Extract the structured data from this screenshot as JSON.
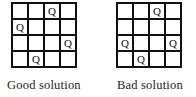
{
  "boards": [
    {
      "caption": "Good solution",
      "queen_label": "Q",
      "cells": [
        [
          "",
          "",
          "Q",
          ""
        ],
        [
          "Q",
          "",
          "",
          ""
        ],
        [
          "",
          "",
          "",
          "Q"
        ],
        [
          "",
          "Q",
          "",
          ""
        ]
      ]
    },
    {
      "caption": "Bad solution",
      "queen_label": "Q",
      "cells": [
        [
          "",
          "",
          "Q",
          ""
        ],
        [
          "",
          "",
          "",
          ""
        ],
        [
          "Q",
          "",
          "",
          "Q"
        ],
        [
          "",
          "Q",
          "",
          ""
        ]
      ]
    }
  ]
}
